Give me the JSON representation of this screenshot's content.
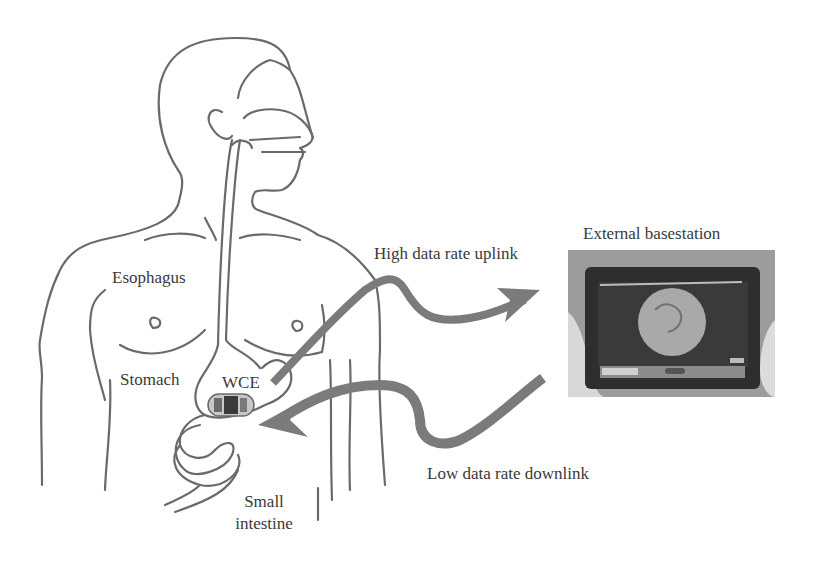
{
  "figure": {
    "labels": {
      "esophagus": "Esophagus",
      "stomach": "Stomach",
      "wce": "WCE",
      "small_intestine_line1": "Small",
      "small_intestine_line2": "intestine",
      "uplink": "High data rate uplink",
      "downlink": "Low data rate downlink",
      "basestation": "External basestation"
    },
    "colors": {
      "outline": "#6a6a6a",
      "arrow": "#7b7b7b",
      "text": "#3a3a3a",
      "tablet_body": "#2e2e2e",
      "photo_bg": "#9a9a9a",
      "capsule": "#8a8a8a"
    }
  }
}
